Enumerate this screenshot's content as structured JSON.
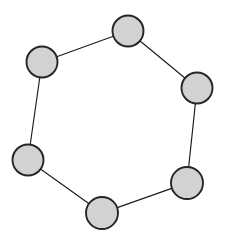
{
  "figure": {
    "title": "",
    "background_color": "#ffffff",
    "width": 230,
    "height": 247
  },
  "chart_data": {
    "type": "diagram",
    "diagram_type": "graph",
    "graph_family": "cycle-graph",
    "title": "",
    "xlabel": "",
    "ylabel": "",
    "grid": false,
    "legend": "none",
    "node_count": 6,
    "edge_count": 6,
    "node_style": {
      "shape": "circle",
      "fill_color": "#d2d2d2",
      "stroke_color": "#252525",
      "stroke_width": 1.9,
      "radius": 15.5,
      "label": ""
    },
    "edge_style": {
      "stroke_color": "#1c1c1c",
      "stroke_width": 1.15,
      "directed": false,
      "label": ""
    },
    "nodes": [
      {
        "id": "n1",
        "label": "",
        "cx": 128,
        "cy": 31,
        "r": 15.5,
        "position": "top"
      },
      {
        "id": "n2",
        "label": "",
        "cx": 197,
        "cy": 88,
        "r": 15.5,
        "position": "upper-right"
      },
      {
        "id": "n3",
        "label": "",
        "cx": 187,
        "cy": 183,
        "r": 16.0,
        "position": "lower-right"
      },
      {
        "id": "n4",
        "label": "",
        "cx": 102,
        "cy": 213,
        "r": 16.0,
        "position": "bottom"
      },
      {
        "id": "n5",
        "label": "",
        "cx": 28,
        "cy": 160,
        "r": 15.5,
        "position": "lower-left"
      },
      {
        "id": "n6",
        "label": "",
        "cx": 42,
        "cy": 62,
        "r": 15.5,
        "position": "upper-left"
      }
    ],
    "edges": [
      {
        "id": "e1",
        "source": "n1",
        "target": "n2",
        "label": ""
      },
      {
        "id": "e2",
        "source": "n2",
        "target": "n3",
        "label": ""
      },
      {
        "id": "e3",
        "source": "n3",
        "target": "n4",
        "label": ""
      },
      {
        "id": "e4",
        "source": "n4",
        "target": "n5",
        "label": ""
      },
      {
        "id": "e5",
        "source": "n5",
        "target": "n6",
        "label": ""
      },
      {
        "id": "e6",
        "source": "n6",
        "target": "n1",
        "label": ""
      }
    ]
  }
}
